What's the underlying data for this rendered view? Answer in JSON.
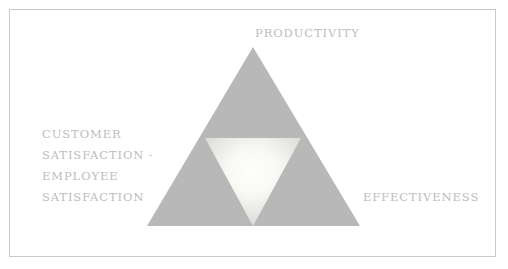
{
  "diagram": {
    "type": "triangle-framework",
    "title_visible": false,
    "frame": {
      "border_color": "#c9c9c9",
      "background_color": "#ffffff"
    },
    "outer_triangle": {
      "name": "outer-triangle",
      "fill_color": "#b8b8b8",
      "apex": {
        "x": 253,
        "y": 47
      },
      "base_left": {
        "x": 147,
        "y": 226
      },
      "base_right": {
        "x": 360,
        "y": 226
      }
    },
    "inner_triangle": {
      "name": "inner-inverted-triangle",
      "orientation": "inverted",
      "gradient_center_color": "#fdfdfb",
      "gradient_edge_color": "#d8d8d4",
      "top_left": {
        "x": 205,
        "y": 138
      },
      "top_right": {
        "x": 301,
        "y": 138
      },
      "bottom_vertex": {
        "x": 253,
        "y": 226
      }
    },
    "labels": {
      "top": "PRODUCTIVITY",
      "right": "EFFECTIVENESS",
      "left_lines": [
        "CUSTOMER",
        "SATISFACTION -",
        "EMPLOYEE",
        "SATISFACTION"
      ],
      "text_color": "#bdbdbd"
    }
  }
}
